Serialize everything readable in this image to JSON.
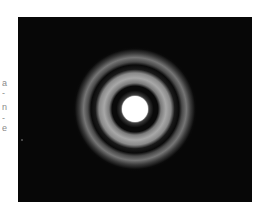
{
  "image": {
    "description": "Airy diffraction pattern: bright central disk surrounded by concentric rings on black background",
    "background_color": "#070707",
    "center": [
      135,
      109
    ],
    "central_disk": {
      "radius": 13,
      "color": "#ffffff"
    },
    "rings": [
      {
        "inner_radius": 24,
        "outer_radius": 38,
        "peak_color": "#a8a8a8"
      },
      {
        "inner_radius": 47,
        "outer_radius": 56,
        "peak_color": "#767676"
      }
    ]
  },
  "margin_fragments": [
    "a",
    "-",
    "n",
    "-",
    "e"
  ]
}
